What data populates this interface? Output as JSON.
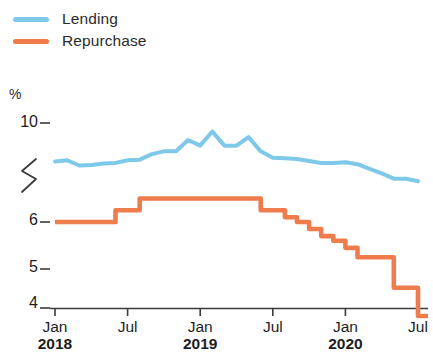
{
  "legend": {
    "items": [
      {
        "label": "Lending",
        "color": "#7ec8ea",
        "icon": "line-swatch-icon"
      },
      {
        "label": "Repurchase",
        "color": "#ef7c4c",
        "icon": "line-swatch-icon"
      }
    ]
  },
  "axes": {
    "unit_label": "%",
    "y_ticks": [
      "10",
      "6",
      "5",
      "4"
    ],
    "y_break_symbol": "axis-break-squiggle",
    "x_ticks": [
      {
        "month": "Jan",
        "year": "2018"
      },
      {
        "month": "Jul",
        "year": ""
      },
      {
        "month": "Jan",
        "year": "2019"
      },
      {
        "month": "Jul",
        "year": ""
      },
      {
        "month": "Jan",
        "year": "2020"
      },
      {
        "month": "Jul",
        "year": ""
      }
    ]
  },
  "chart_data": {
    "type": "line",
    "title": "",
    "subtitle": "",
    "xlabel": "",
    "ylabel": "%",
    "grid": false,
    "legend_position": "top-left",
    "axis_break": {
      "between": [
        6.6,
        9.4
      ],
      "note": "y-axis broken between 6 and 10"
    },
    "ylim": [
      4,
      10
    ],
    "y_ticks": [
      10,
      6,
      5,
      4
    ],
    "x": [
      "Jan 2018",
      "Feb 2018",
      "Mar 2018",
      "Apr 2018",
      "May 2018",
      "Jun 2018",
      "Jul 2018",
      "Aug 2018",
      "Sep 2018",
      "Oct 2018",
      "Nov 2018",
      "Dec 2018",
      "Jan 2019",
      "Feb 2019",
      "Mar 2019",
      "Apr 2019",
      "May 2019",
      "Jun 2019",
      "Jul 2019",
      "Aug 2019",
      "Sep 2019",
      "Oct 2019",
      "Nov 2019",
      "Dec 2019",
      "Jan 2020",
      "Feb 2020",
      "Mar 2020",
      "Apr 2020",
      "May 2020",
      "Jun 2020",
      "Jul 2020"
    ],
    "series": [
      {
        "name": "Lending",
        "color": "#7ec8ea",
        "style": "smooth",
        "values": [
          9.05,
          9.15,
          8.75,
          8.8,
          8.9,
          8.95,
          9.15,
          9.2,
          9.45,
          9.5,
          9.5,
          9.7,
          9.6,
          9.85,
          9.6,
          9.6,
          9.75,
          9.5,
          9.35,
          9.3,
          9.25,
          9.1,
          8.95,
          8.95,
          9.0,
          8.85,
          8.5,
          8.15,
          7.75,
          7.75,
          7.55
        ]
      },
      {
        "name": "Repurchase",
        "color": "#ef7c4c",
        "style": "step",
        "values": [
          6.0,
          6.0,
          6.0,
          6.0,
          6.0,
          6.25,
          6.25,
          6.5,
          6.5,
          6.5,
          6.5,
          6.5,
          6.5,
          6.5,
          6.5,
          6.5,
          6.5,
          6.25,
          6.25,
          6.1,
          6.0,
          5.85,
          5.7,
          5.6,
          5.45,
          5.25,
          5.25,
          5.25,
          4.6,
          4.6,
          4.0
        ]
      }
    ]
  }
}
